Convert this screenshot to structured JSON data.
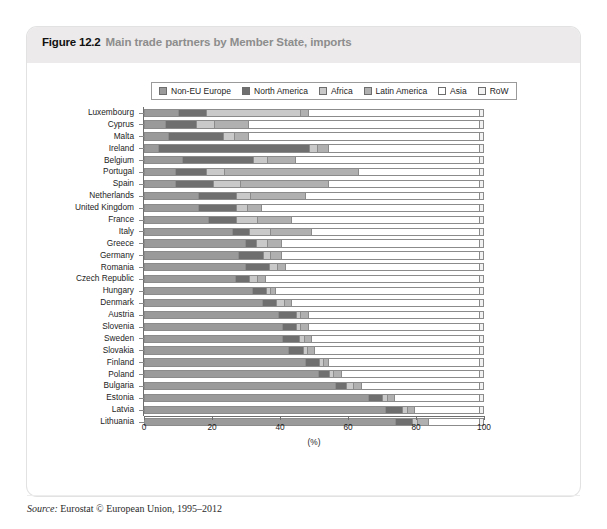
{
  "figure": {
    "number": "Figure 12.2",
    "caption": "Main trade partners by Member State, imports",
    "source_word": "Source:",
    "source_text": " Eurostat © European Union, 1995–2012"
  },
  "colors": {
    "non_eu_europe": "#9a9a9a",
    "north_america": "#6f6f6f",
    "africa": "#c9c9c9",
    "latin_america": "#b0b0b0",
    "asia": "#ffffff",
    "row": "#f2f2f2",
    "axis": "#6f6f6f",
    "panel_header": "#eceaea"
  },
  "chart_data": {
    "type": "bar",
    "orientation": "horizontal",
    "stacked": true,
    "title": "Main trade partners by Member State, imports",
    "xlabel": "(%)",
    "ylabel": "",
    "xlim": [
      0,
      100
    ],
    "xticks": [
      0,
      20,
      40,
      60,
      80,
      100
    ],
    "grid": false,
    "legend_position": "top",
    "legend": [
      "Non-EU Europe",
      "North America",
      "Africa",
      "Latin America",
      "Asia",
      "RoW"
    ],
    "categories": [
      "Luxembourg",
      "Cyprus",
      "Malta",
      "Ireland",
      "Belgium",
      "Portugal",
      "Spain",
      "Netherlands",
      "United Kingdom",
      "France",
      "Italy",
      "Greece",
      "Germany",
      "Romania",
      "Czech Republic",
      "Hungary",
      "Denmark",
      "Austria",
      "Slovenia",
      "Sweden",
      "Slovakia",
      "Finland",
      "Poland",
      "Bulgaria",
      "Estonia",
      "Latvia",
      "Lithuania"
    ],
    "series": [
      {
        "name": "Non-EU Europe",
        "values": [
          10,
          6,
          7,
          4,
          11,
          9,
          9,
          16,
          16,
          19,
          26,
          30,
          28,
          30,
          27,
          32,
          35,
          40,
          41,
          41,
          43,
          48,
          52,
          57,
          67,
          72,
          75
        ]
      },
      {
        "name": "North America",
        "values": [
          8,
          9,
          16,
          45,
          21,
          9,
          11,
          11,
          11,
          8,
          5,
          3,
          7,
          7,
          4,
          4,
          4,
          5,
          4,
          5,
          4,
          4,
          3,
          3,
          4,
          5,
          5
        ]
      },
      {
        "name": "Africa",
        "values": [
          28,
          5,
          3,
          2,
          4,
          5,
          8,
          4,
          3,
          6,
          6,
          3,
          2,
          2,
          2,
          1,
          2,
          1,
          1,
          1,
          1,
          1,
          1,
          2,
          1,
          1,
          1
        ]
      },
      {
        "name": "Latin America",
        "values": [
          2,
          10,
          4,
          3,
          8,
          40,
          26,
          16,
          4,
          10,
          12,
          4,
          3,
          2,
          2,
          1,
          2,
          2,
          2,
          2,
          2,
          1,
          2,
          2,
          2,
          2,
          3
        ]
      },
      {
        "name": "Asia",
        "values": [
          51,
          69,
          69,
          45,
          55,
          36,
          45,
          52,
          65,
          56,
          50,
          59,
          59,
          58,
          64,
          61,
          56,
          51,
          51,
          50,
          49,
          45,
          41,
          35,
          25,
          19,
          15
        ]
      },
      {
        "name": "RoW",
        "values": [
          1,
          1,
          1,
          1,
          1,
          1,
          1,
          1,
          1,
          1,
          1,
          1,
          1,
          1,
          1,
          1,
          1,
          1,
          1,
          1,
          1,
          1,
          1,
          1,
          1,
          1,
          1
        ]
      }
    ]
  }
}
